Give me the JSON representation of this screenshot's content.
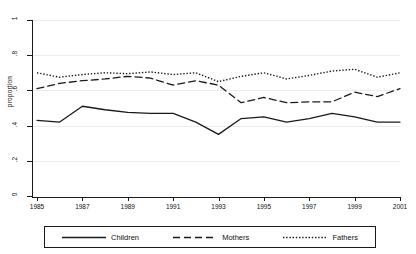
{
  "chart_data": {
    "type": "line",
    "title": "",
    "xlabel": "",
    "ylabel": "proportion",
    "xlim": [
      1985,
      2001
    ],
    "ylim": [
      0,
      1
    ],
    "grid": true,
    "legend_position": "bottom",
    "x": [
      1985,
      1986,
      1987,
      1988,
      1989,
      1990,
      1991,
      1992,
      1993,
      1994,
      1995,
      1996,
      1997,
      1998,
      1999,
      2000,
      2001
    ],
    "xticks": [
      "1985",
      "1987",
      "1989",
      "1991",
      "1993",
      "1995",
      "1997",
      "1999",
      "2001"
    ],
    "xtick_values": [
      1985,
      1987,
      1989,
      1991,
      1993,
      1995,
      1997,
      1999,
      2001
    ],
    "yticks": [
      "1",
      ".8",
      ".6",
      ".4",
      ".2",
      "0"
    ],
    "ytick_values": [
      1,
      0.8,
      0.6,
      0.4,
      0.2,
      0
    ],
    "series": [
      {
        "name": "Children",
        "style": "solid",
        "color": "#1a1a1a",
        "values": [
          0.43,
          0.42,
          0.51,
          0.49,
          0.475,
          0.47,
          0.47,
          0.42,
          0.35,
          0.44,
          0.45,
          0.42,
          0.44,
          0.47,
          0.45,
          0.42,
          0.42
        ]
      },
      {
        "name": "Mothers",
        "style": "dashed",
        "color": "#1a1a1a",
        "values": [
          0.61,
          0.64,
          0.655,
          0.665,
          0.68,
          0.67,
          0.63,
          0.655,
          0.63,
          0.53,
          0.56,
          0.53,
          0.535,
          0.535,
          0.59,
          0.565,
          0.61
        ]
      },
      {
        "name": "Fathers",
        "style": "dotted",
        "color": "#1a1a1a",
        "values": [
          0.7,
          0.675,
          0.69,
          0.7,
          0.695,
          0.705,
          0.69,
          0.7,
          0.65,
          0.68,
          0.7,
          0.665,
          0.685,
          0.71,
          0.72,
          0.675,
          0.7
        ]
      }
    ]
  },
  "legend": {
    "items": [
      {
        "label": "Children",
        "style": "solid"
      },
      {
        "label": "Mothers",
        "style": "dashed"
      },
      {
        "label": "Fathers",
        "style": "dotted"
      }
    ]
  }
}
